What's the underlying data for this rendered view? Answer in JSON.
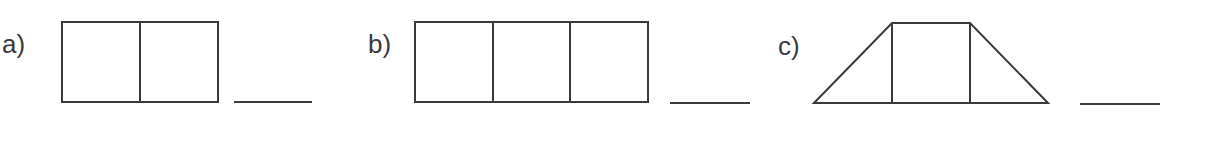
{
  "problems": [
    {
      "label": "a)",
      "shape": "rectangle split into 2 equal parts",
      "answer": ""
    },
    {
      "label": "b)",
      "shape": "rectangle split into 3 equal parts",
      "answer": ""
    },
    {
      "label": "c)",
      "shape": "trapezoid split into 2 triangles and 1 square",
      "answer": ""
    }
  ],
  "colors": {
    "stroke": "#3a3a3a",
    "background": "#ffffff"
  }
}
